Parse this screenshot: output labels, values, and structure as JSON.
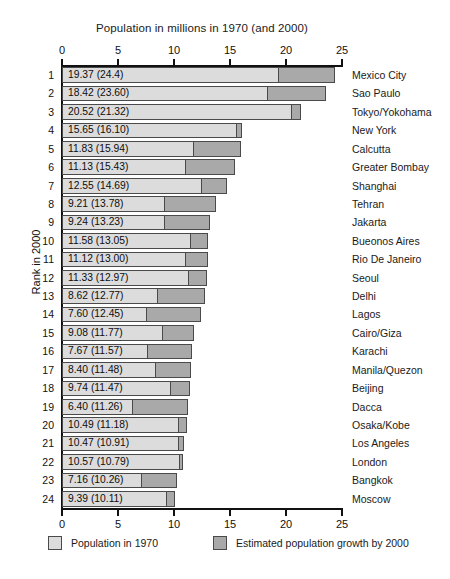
{
  "chart_data": {
    "type": "bar",
    "subtype": "stacked-horizontal",
    "title": "Population in millions in 1970 (and 2000)",
    "xlabel": "",
    "ylabel": "Rank in 2000",
    "xlim": [
      0,
      25
    ],
    "xticks": [
      0,
      5,
      10,
      15,
      20,
      25
    ],
    "xtick_labels": [
      "0",
      "5",
      "10",
      "15",
      "20",
      "25"
    ],
    "axis_top": true,
    "axis_bottom": true,
    "grid": false,
    "legend_position": "bottom",
    "categories": [
      "Mexico City",
      "Sao Paulo",
      "Tokyo/Yokohama",
      "New York",
      "Calcutta",
      "Greater Bombay",
      "Shanghai",
      "Tehran",
      "Jakarta",
      "Bueonos Aires",
      "Rio De Janeiro",
      "Seoul",
      "Delhi",
      "Lagos",
      "Cairo/Giza",
      "Karachi",
      "Manila/Quezon",
      "Beijing",
      "Dacca",
      "Osaka/Kobe",
      "Los Angeles",
      "London",
      "Bangkok",
      "Moscow"
    ],
    "series": [
      {
        "name": "Population in 1970",
        "color": "#dcdcdc",
        "values": [
          19.37,
          18.42,
          20.52,
          15.65,
          11.83,
          11.13,
          12.55,
          9.21,
          9.24,
          11.58,
          11.12,
          11.33,
          8.62,
          7.6,
          9.08,
          7.67,
          8.4,
          9.74,
          6.4,
          10.49,
          10.47,
          10.57,
          7.16,
          9.39
        ]
      },
      {
        "name": "Estimated population growth by 2000",
        "color": "#a9a9a9",
        "values": [
          5.03,
          5.18,
          0.8,
          0.45,
          4.11,
          4.3,
          2.14,
          4.57,
          3.99,
          1.47,
          1.88,
          1.64,
          4.15,
          4.85,
          2.69,
          3.9,
          3.08,
          1.73,
          4.86,
          0.69,
          0.44,
          0.22,
          3.1,
          0.72
        ]
      }
    ],
    "totals_2000": [
      24.4,
      23.6,
      21.32,
      16.1,
      15.94,
      15.43,
      14.69,
      13.78,
      13.23,
      13.05,
      13.0,
      12.97,
      12.77,
      12.45,
      11.77,
      11.57,
      11.48,
      11.47,
      11.26,
      11.18,
      10.91,
      10.79,
      10.26,
      10.11
    ]
  },
  "rows": [
    {
      "rank": "1",
      "value_label": "19.37 (24.4)",
      "city": "Mexico City",
      "v1970": 19.37,
      "v2000": 24.4
    },
    {
      "rank": "2",
      "value_label": "18.42 (23.60)",
      "city": "Sao Paulo",
      "v1970": 18.42,
      "v2000": 23.6
    },
    {
      "rank": "3",
      "value_label": "20.52 (21.32)",
      "city": "Tokyo/Yokohama",
      "v1970": 20.52,
      "v2000": 21.32
    },
    {
      "rank": "4",
      "value_label": "15.65 (16.10)",
      "city": "New York",
      "v1970": 15.65,
      "v2000": 16.1
    },
    {
      "rank": "5",
      "value_label": "11.83 (15.94)",
      "city": "Calcutta",
      "v1970": 11.83,
      "v2000": 15.94
    },
    {
      "rank": "6",
      "value_label": "11.13 (15.43)",
      "city": "Greater Bombay",
      "v1970": 11.13,
      "v2000": 15.43
    },
    {
      "rank": "7",
      "value_label": "12.55 (14.69)",
      "city": "Shanghai",
      "v1970": 12.55,
      "v2000": 14.69
    },
    {
      "rank": "8",
      "value_label": "9.21 (13.78)",
      "city": "Tehran",
      "v1970": 9.21,
      "v2000": 13.78
    },
    {
      "rank": "9",
      "value_label": "9.24 (13.23)",
      "city": "Jakarta",
      "v1970": 9.24,
      "v2000": 13.23
    },
    {
      "rank": "10",
      "value_label": "11.58 (13.05)",
      "city": "Bueonos Aires",
      "v1970": 11.58,
      "v2000": 13.05
    },
    {
      "rank": "11",
      "value_label": "11.12 (13.00)",
      "city": "Rio De Janeiro",
      "v1970": 11.12,
      "v2000": 13.0
    },
    {
      "rank": "12",
      "value_label": "11.33 (12.97)",
      "city": "Seoul",
      "v1970": 11.33,
      "v2000": 12.97
    },
    {
      "rank": "13",
      "value_label": "8.62 (12.77)",
      "city": "Delhi",
      "v1970": 8.62,
      "v2000": 12.77
    },
    {
      "rank": "14",
      "value_label": "7.60 (12.45)",
      "city": "Lagos",
      "v1970": 7.6,
      "v2000": 12.45
    },
    {
      "rank": "15",
      "value_label": "9.08 (11.77)",
      "city": "Cairo/Giza",
      "v1970": 9.08,
      "v2000": 11.77
    },
    {
      "rank": "16",
      "value_label": "7.67 (11.57)",
      "city": "Karachi",
      "v1970": 7.67,
      "v2000": 11.57
    },
    {
      "rank": "17",
      "value_label": "8.40 (11.48)",
      "city": "Manila/Quezon",
      "v1970": 8.4,
      "v2000": 11.48
    },
    {
      "rank": "18",
      "value_label": "9.74 (11.47)",
      "city": "Beijing",
      "v1970": 9.74,
      "v2000": 11.47
    },
    {
      "rank": "19",
      "value_label": "6.40 (11.26)",
      "city": "Dacca",
      "v1970": 6.4,
      "v2000": 11.26
    },
    {
      "rank": "20",
      "value_label": "10.49 (11.18)",
      "city": "Osaka/Kobe",
      "v1970": 10.49,
      "v2000": 11.18
    },
    {
      "rank": "21",
      "value_label": "10.47 (10.91)",
      "city": "Los Angeles",
      "v1970": 10.47,
      "v2000": 10.91
    },
    {
      "rank": "22",
      "value_label": "10.57 (10.79)",
      "city": "London",
      "v1970": 10.57,
      "v2000": 10.79
    },
    {
      "rank": "23",
      "value_label": "7.16 (10.26)",
      "city": "Bangkok",
      "v1970": 7.16,
      "v2000": 10.26
    },
    {
      "rank": "24",
      "value_label": "9.39 (10.11)",
      "city": "Moscow",
      "v1970": 9.39,
      "v2000": 10.11
    }
  ],
  "axis": {
    "title": "Population in millions in 1970 (and 2000)",
    "y_label": "Rank in 2000",
    "ticks": [
      "0",
      "5",
      "10",
      "15",
      "20",
      "25"
    ]
  },
  "legend": {
    "items": [
      {
        "label": "Population in 1970",
        "color": "#dcdcdc"
      },
      {
        "label": "Estimated population growth by 2000",
        "color": "#a9a9a9"
      }
    ]
  },
  "colors": {
    "bar_1970": "#dcdcdc",
    "bar_growth": "#a9a9a9",
    "bar_border": "#4a4a4a",
    "axis": "#111111",
    "background": "#ffffff"
  }
}
